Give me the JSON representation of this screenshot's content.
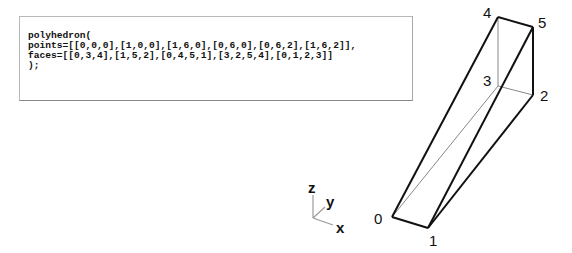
{
  "code": {
    "lines": [
      "polyhedron(",
      "points=[[0,0,0],[1,0,0],[1,6,0],[0,6,0],[0,6,2],[1,6,2]],",
      "faces=[[0,3,4],[1,5,2],[0,4,5,1],[3,2,5,4],[0,1,2,3]]",
      ");"
    ]
  },
  "axes": {
    "z_label": "z",
    "y_label": "y",
    "x_label": "x"
  },
  "polyhedron": {
    "vertex_labels": [
      "0",
      "1",
      "2",
      "3",
      "4",
      "5"
    ],
    "line_color": "#111111",
    "hidden_line_color": "#888888"
  }
}
